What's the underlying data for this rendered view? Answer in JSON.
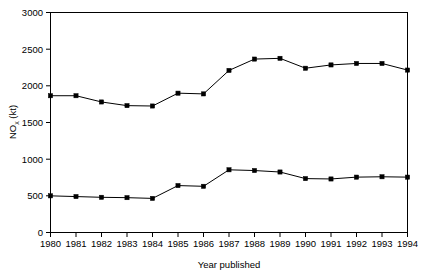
{
  "chart_data": {
    "type": "line",
    "title": "",
    "subtitle": "",
    "xlabel": "Year published",
    "ylabel": "NOx (kt)",
    "ylabel_main": "NO",
    "ylabel_sub": "x",
    "ylabel_unit": " (kt)",
    "categories": [
      "1980",
      "1981",
      "1982",
      "1983",
      "1984",
      "1985",
      "1986",
      "1987",
      "1988",
      "1989",
      "1990",
      "1991",
      "1992",
      "1993",
      "1994"
    ],
    "x": [
      1980,
      1981,
      1982,
      1983,
      1984,
      1985,
      1986,
      1987,
      1988,
      1989,
      1990,
      1991,
      1992,
      1993,
      1994
    ],
    "series": [
      {
        "name": "upper-series",
        "values": [
          1865,
          1865,
          1780,
          1730,
          1725,
          1900,
          1890,
          2210,
          2365,
          2375,
          2240,
          2285,
          2305,
          2305,
          2215
        ]
      },
      {
        "name": "lower-series",
        "values": [
          500,
          490,
          480,
          475,
          465,
          640,
          630,
          855,
          845,
          825,
          735,
          730,
          755,
          760,
          755
        ]
      }
    ],
    "ylim": [
      0,
      3000
    ],
    "xlim": [
      1980,
      1994
    ],
    "yticks": [
      0,
      500,
      1000,
      1500,
      2000,
      2500,
      3000
    ],
    "ytick_labels": [
      "0",
      "500",
      "1000",
      "1500",
      "2000",
      "2500",
      "3000"
    ],
    "xtick_labels": [
      "1980",
      "1981",
      "1982",
      "1983",
      "1984",
      "1985",
      "1986",
      "1987",
      "1988",
      "1989",
      "1990",
      "1991",
      "1992",
      "1993",
      "1994"
    ],
    "grid": false,
    "legend": false,
    "legend_position": "none",
    "line_color": "#000000",
    "marker_color": "#000000",
    "marker_shape": "square",
    "background_color": "#ffffff",
    "frame_color": "#000000"
  }
}
